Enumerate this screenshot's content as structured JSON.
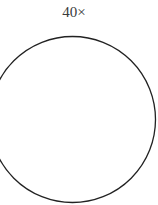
{
  "magnification_label": "40×",
  "field_of_view": {
    "shape": "circle",
    "stroke_color": "#222222",
    "fill_color": "#ffffff"
  }
}
